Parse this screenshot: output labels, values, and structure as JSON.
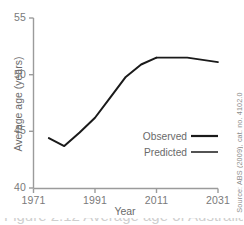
{
  "chart_data": {
    "type": "line",
    "title": "",
    "xlabel": "Year",
    "ylabel": "Average age (years)",
    "xlim": [
      1971,
      2031
    ],
    "ylim": [
      40,
      55
    ],
    "xticks": [
      1971,
      1991,
      2011,
      2031
    ],
    "xticklabels": [
      "1971",
      "1991",
      "2011",
      "2031"
    ],
    "yticks": [
      40,
      45,
      50,
      55
    ],
    "yticklabels": [
      "40",
      "45",
      "50",
      "55"
    ],
    "grid": false,
    "legend_position": "center-right",
    "series": [
      {
        "name": "Observed",
        "x": [
          1976,
          1981,
          1986,
          1991,
          1996,
          2001,
          2006,
          2011
        ],
        "values": [
          44.4,
          43.7,
          44.9,
          46.2,
          48.0,
          49.8,
          50.9,
          51.5
        ]
      },
      {
        "name": "Predicted",
        "x": [
          2011,
          2016,
          2021,
          2026,
          2031
        ],
        "values": [
          51.5,
          51.5,
          51.5,
          51.3,
          51.1
        ]
      }
    ]
  },
  "axes": {
    "y_title": "Average age (years)",
    "x_title": "Year",
    "y_tick_labels": [
      "55",
      "50",
      "45",
      "40"
    ],
    "x_tick_labels": [
      "1971",
      "1991",
      "2011",
      "2031"
    ]
  },
  "legend": {
    "items": [
      {
        "label": "Observed",
        "swatch": "thick-line"
      },
      {
        "label": "Predicted",
        "swatch": "thin-line"
      }
    ]
  },
  "source": {
    "text": "Source: ABS (2009), cat. no. 4102.0"
  },
  "footer": {
    "clipped_caption": "Figure 2.12 Average age of Australian"
  },
  "colors": {
    "line": "#1a1a1a",
    "axis": "#9b9b9b",
    "tick_text": "#7a7a7a",
    "background": "#ffffff"
  }
}
